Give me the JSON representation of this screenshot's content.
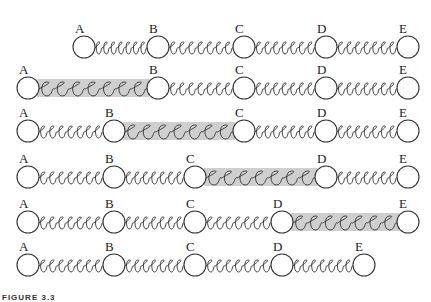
{
  "figure": {
    "caption": "FIGURE 3.3",
    "ball_radius": 11,
    "colors": {
      "stroke": "#333333",
      "shade": "#cfcfcf",
      "background": "#ffffff"
    },
    "rows": [
      {
        "y": 47,
        "balls": [
          {
            "label": "A",
            "x": 84
          },
          {
            "label": "B",
            "x": 158
          },
          {
            "label": "C",
            "x": 244
          },
          {
            "label": "D",
            "x": 326
          },
          {
            "label": "E",
            "x": 408
          }
        ],
        "stretched": null
      },
      {
        "y": 88,
        "balls": [
          {
            "label": "A",
            "x": 28
          },
          {
            "label": "B",
            "x": 158
          },
          {
            "label": "C",
            "x": 244
          },
          {
            "label": "D",
            "x": 326
          },
          {
            "label": "E",
            "x": 408
          }
        ],
        "stretched": 0
      },
      {
        "y": 131,
        "balls": [
          {
            "label": "A",
            "x": 28
          },
          {
            "label": "B",
            "x": 114
          },
          {
            "label": "C",
            "x": 244
          },
          {
            "label": "D",
            "x": 326
          },
          {
            "label": "E",
            "x": 408
          }
        ],
        "stretched": 1
      },
      {
        "y": 177,
        "balls": [
          {
            "label": "A",
            "x": 28
          },
          {
            "label": "B",
            "x": 114
          },
          {
            "label": "C",
            "x": 195
          },
          {
            "label": "D",
            "x": 326
          },
          {
            "label": "E",
            "x": 408
          }
        ],
        "stretched": 2
      },
      {
        "y": 222,
        "balls": [
          {
            "label": "A",
            "x": 28
          },
          {
            "label": "B",
            "x": 114
          },
          {
            "label": "C",
            "x": 195
          },
          {
            "label": "D",
            "x": 282
          },
          {
            "label": "E",
            "x": 408
          }
        ],
        "stretched": 3
      },
      {
        "y": 265,
        "balls": [
          {
            "label": "A",
            "x": 28
          },
          {
            "label": "B",
            "x": 114
          },
          {
            "label": "C",
            "x": 195
          },
          {
            "label": "D",
            "x": 282
          },
          {
            "label": "E",
            "x": 364
          }
        ],
        "stretched": null
      }
    ]
  }
}
